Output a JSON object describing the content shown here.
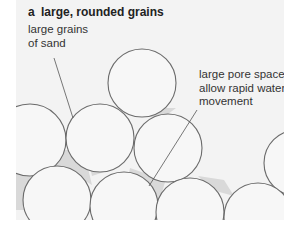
{
  "figure": {
    "panel_letter": "a",
    "title": "large, rounded grains",
    "labels": {
      "grains": {
        "lines": [
          "large grains",
          "of sand"
        ]
      },
      "pores": {
        "lines": [
          "large pore spaces",
          "allow rapid water",
          "movement"
        ]
      }
    },
    "colors": {
      "panel_background": "#f3f3f3",
      "grain_fill": "#f7f7f7",
      "grain_stroke": "#6b6b6b",
      "pore_fill": "#d9d9d9",
      "text": "#333333"
    },
    "grains": [
      {
        "cx": 142,
        "cy": 83,
        "r": 34
      },
      {
        "cx": 30,
        "cy": 140,
        "r": 36
      },
      {
        "cx": 100,
        "cy": 138,
        "r": 34
      },
      {
        "cx": 168,
        "cy": 148,
        "r": 34
      },
      {
        "cx": 297,
        "cy": 163,
        "r": 33
      },
      {
        "cx": 57,
        "cy": 200,
        "r": 34
      },
      {
        "cx": 124,
        "cy": 206,
        "r": 34
      },
      {
        "cx": 190,
        "cy": 212,
        "r": 34
      },
      {
        "cx": 258,
        "cy": 217,
        "r": 34
      }
    ],
    "leader_lines": [
      {
        "x1": 54,
        "y1": 58,
        "x2": 73,
        "y2": 118
      },
      {
        "x1": 197,
        "y1": 110,
        "x2": 149,
        "y2": 186
      }
    ]
  }
}
